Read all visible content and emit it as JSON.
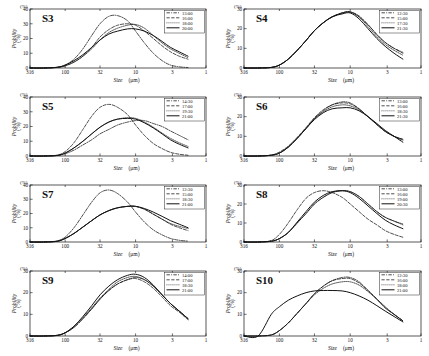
{
  "figure": {
    "panel_count": 8,
    "axis": {
      "xlabel_italic": "Size",
      "xlabel_unit": "(μm)",
      "ylabel_italic": "Probility",
      "ylabel_unit": "(%)",
      "x_ticks": [
        "316",
        "100",
        "32",
        "10",
        "3",
        "1"
      ],
      "x_tick_values": [
        316,
        100,
        32,
        10,
        3,
        1
      ],
      "y_ticks_40": [
        "0",
        "10",
        "20",
        "30",
        "40"
      ],
      "y_ticks_30": [
        "0",
        "10",
        "20",
        "30"
      ],
      "percent_marker": "(%)"
    },
    "line_styles": [
      "dashdot",
      "dashed",
      "dotted",
      "solid"
    ]
  },
  "chart_data": [
    {
      "type": "line",
      "title": "S3",
      "xlabel": "Size (μm)",
      "ylabel": "Probility (%)",
      "xlim": [
        316,
        1
      ],
      "ylim": [
        0,
        40
      ],
      "xscale": "log-reversed",
      "x_ticks": [
        316,
        100,
        32,
        10,
        3,
        1
      ],
      "y_ticks": [
        0,
        10,
        20,
        30,
        40
      ],
      "legend_position": "top-right",
      "x": [
        316,
        200,
        130,
        100,
        75,
        56,
        42,
        32,
        24,
        18,
        13,
        10,
        7.5,
        5.6,
        4.2,
        3.2,
        2.4,
        1.8
      ],
      "series": [
        {
          "name": "13:00",
          "style": "dashdot",
          "values": [
            0,
            0,
            0.5,
            2,
            6,
            13,
            22,
            30,
            35,
            35.5,
            32,
            25,
            17,
            10,
            5,
            2,
            0.8,
            0.3
          ]
        },
        {
          "name": "16:00",
          "style": "dashed",
          "values": [
            0,
            0,
            0.4,
            1.5,
            4,
            8,
            14,
            21,
            26,
            29,
            30,
            29,
            25,
            20,
            15,
            11,
            8,
            6
          ]
        },
        {
          "name": "18:00",
          "style": "dotted",
          "values": [
            0,
            0,
            0.4,
            1.5,
            4,
            8,
            13,
            19,
            24,
            27,
            29,
            29.5,
            27,
            22,
            17,
            13,
            10,
            7
          ]
        },
        {
          "name": "20:00",
          "style": "solid",
          "values": [
            0,
            0,
            0.5,
            2,
            5,
            9,
            14,
            19,
            23,
            25,
            26.5,
            26.5,
            25,
            22,
            18,
            14,
            11,
            8
          ]
        }
      ]
    },
    {
      "type": "line",
      "title": "S4",
      "xlabel": "Size (μm)",
      "ylabel": "Probility (%)",
      "xlim": [
        316,
        1
      ],
      "ylim": [
        0,
        30
      ],
      "xscale": "log-reversed",
      "x_ticks": [
        316,
        100,
        32,
        10,
        3,
        1
      ],
      "y_ticks": [
        0,
        10,
        20,
        30
      ],
      "legend_position": "top-right",
      "x": [
        316,
        200,
        130,
        100,
        75,
        56,
        42,
        32,
        24,
        18,
        13,
        10,
        7.5,
        5.6,
        4.2,
        3.2,
        2.4,
        1.8
      ],
      "series": [
        {
          "name": "12:30",
          "style": "dashdot",
          "values": [
            0,
            0,
            0.3,
            1.5,
            4.5,
            9,
            14,
            19,
            23,
            26,
            28,
            28.5,
            26,
            22,
            17,
            13,
            10,
            8
          ]
        },
        {
          "name": "15:00",
          "style": "dashed",
          "values": [
            0,
            0,
            0.3,
            1.5,
            4.5,
            9,
            14,
            19,
            23,
            26,
            28,
            28.5,
            26.5,
            22,
            17,
            13,
            10,
            7.5
          ]
        },
        {
          "name": "17:30",
          "style": "dotted",
          "values": [
            0,
            0,
            0.3,
            1.5,
            4.5,
            9,
            14,
            19,
            23,
            26,
            28,
            28.5,
            26,
            21,
            16,
            12,
            9,
            6.5
          ]
        },
        {
          "name": "21:30",
          "style": "solid",
          "values": [
            0,
            0,
            0.3,
            1.5,
            4.5,
            9,
            14,
            19,
            23,
            26,
            27.5,
            28,
            25,
            20,
            15,
            11,
            7.5,
            4.5
          ]
        }
      ]
    },
    {
      "type": "line",
      "title": "S5",
      "xlabel": "Size (μm)",
      "ylabel": "Probility (%)",
      "xlim": [
        316,
        1
      ],
      "ylim": [
        0,
        40
      ],
      "xscale": "log-reversed",
      "x_ticks": [
        316,
        100,
        32,
        10,
        3,
        1
      ],
      "y_ticks": [
        0,
        10,
        20,
        30,
        40
      ],
      "legend_position": "top-right",
      "x": [
        316,
        200,
        130,
        100,
        75,
        56,
        42,
        32,
        24,
        18,
        13,
        10,
        7.5,
        5.6,
        4.2,
        3.2,
        2.4,
        1.8
      ],
      "series": [
        {
          "name": "14:30",
          "style": "dashdot",
          "values": [
            0,
            0,
            0.3,
            1.5,
            4,
            7.5,
            11,
            15,
            18,
            21,
            23,
            24,
            24,
            22,
            20,
            17,
            14,
            11
          ]
        },
        {
          "name": "17:00",
          "style": "dashed",
          "values": [
            0,
            0,
            0.6,
            3,
            9,
            18,
            27,
            33,
            35,
            33,
            28,
            21,
            14,
            8.5,
            5,
            2.5,
            1.2,
            0.5
          ]
        },
        {
          "name": "19:30",
          "style": "dotted",
          "values": [
            0,
            0,
            0.4,
            2,
            5.5,
            10,
            15,
            19.5,
            23,
            25,
            26,
            25.5,
            23,
            19.5,
            15.5,
            12,
            9,
            6.5
          ]
        },
        {
          "name": "21:00",
          "style": "solid",
          "values": [
            0,
            0,
            0.4,
            2,
            5.5,
            10,
            15,
            19.5,
            23,
            25,
            25.5,
            25,
            22.5,
            19,
            15,
            11,
            8,
            5.5
          ]
        }
      ]
    },
    {
      "type": "line",
      "title": "S6",
      "xlabel": "Size (μm)",
      "ylabel": "Probility (%)",
      "xlim": [
        316,
        1
      ],
      "ylim": [
        0,
        30
      ],
      "xscale": "log-reversed",
      "x_ticks": [
        316,
        100,
        32,
        10,
        3,
        1
      ],
      "y_ticks": [
        0,
        10,
        20,
        30
      ],
      "legend_position": "top-right",
      "x": [
        316,
        200,
        130,
        100,
        75,
        56,
        42,
        32,
        24,
        18,
        13,
        10,
        7.5,
        5.6,
        4.2,
        3.2,
        2.4,
        1.8
      ],
      "series": [
        {
          "name": "13:00",
          "style": "dashdot",
          "values": [
            0,
            0,
            0.4,
            1.5,
            4.5,
            9,
            14,
            19,
            23,
            26,
            27.5,
            27,
            24,
            20,
            16,
            12.5,
            10,
            8
          ]
        },
        {
          "name": "16:00",
          "style": "dashed",
          "values": [
            0,
            0,
            0.5,
            2,
            5,
            9.5,
            14.5,
            19.5,
            23.5,
            26,
            27,
            26.5,
            24,
            20,
            16,
            12.5,
            10,
            8.5
          ]
        },
        {
          "name": "18:30",
          "style": "dotted",
          "values": [
            0,
            0,
            0.4,
            1.5,
            4.5,
            9,
            14,
            19,
            22.5,
            25,
            26,
            25.5,
            23.5,
            20,
            16,
            12.5,
            10,
            8.5
          ]
        },
        {
          "name": "21:30",
          "style": "solid",
          "values": [
            0,
            0,
            0.4,
            1.5,
            4.5,
            9,
            14,
            18.5,
            22,
            24,
            24.5,
            24.5,
            23,
            20,
            16.5,
            13,
            10,
            7
          ]
        }
      ]
    },
    {
      "type": "line",
      "title": "S7",
      "xlabel": "Size (μm)",
      "ylabel": "Probility (%)",
      "xlim": [
        316,
        1
      ],
      "ylim": [
        0,
        40
      ],
      "xscale": "log-reversed",
      "x_ticks": [
        316,
        100,
        32,
        10,
        3,
        1
      ],
      "y_ticks": [
        0,
        10,
        20,
        30,
        40
      ],
      "legend_position": "top-right",
      "x": [
        316,
        200,
        130,
        100,
        75,
        56,
        42,
        32,
        24,
        18,
        13,
        10,
        7.5,
        5.6,
        4.2,
        3.2,
        2.4,
        1.8
      ],
      "series": [
        {
          "name": "12:30",
          "style": "dashdot",
          "values": [
            0,
            0,
            0.8,
            3.5,
            10,
            19,
            28,
            34.5,
            36.5,
            34,
            28,
            21,
            14,
            8.5,
            5,
            2.5,
            1.2,
            0.6
          ]
        },
        {
          "name": "15:00",
          "style": "dashed",
          "values": [
            0,
            0,
            0.5,
            2.5,
            6,
            10.5,
            15,
            19,
            22,
            24,
            25,
            25,
            23,
            19.5,
            16,
            12.5,
            10,
            8
          ]
        },
        {
          "name": "18:30",
          "style": "dotted",
          "values": [
            0,
            0,
            0.5,
            2.5,
            6,
            10.5,
            15,
            19,
            22,
            24,
            25,
            25,
            23,
            19.5,
            16,
            13,
            11,
            9.5
          ]
        },
        {
          "name": "21:00",
          "style": "solid",
          "values": [
            0,
            0,
            0.5,
            2.5,
            6,
            10.5,
            15,
            19,
            22,
            24,
            25,
            25,
            23.5,
            21,
            18,
            15,
            12.5,
            10
          ]
        }
      ]
    },
    {
      "type": "line",
      "title": "S8",
      "xlabel": "Size (μm)",
      "ylabel": "Probility (%)",
      "xlim": [
        316,
        1
      ],
      "ylim": [
        0,
        30
      ],
      "xscale": "log-reversed",
      "x_ticks": [
        316,
        100,
        32,
        10,
        3,
        1
      ],
      "y_ticks": [
        0,
        10,
        20,
        30
      ],
      "legend_position": "top-right",
      "x": [
        316,
        200,
        130,
        100,
        75,
        56,
        42,
        32,
        24,
        18,
        13,
        10,
        7.5,
        5.6,
        4.2,
        3.2,
        2.4,
        1.8
      ],
      "series": [
        {
          "name": "13:00",
          "style": "dashdot",
          "values": [
            0,
            0,
            0.4,
            1.8,
            5,
            10,
            15,
            20,
            23.5,
            26,
            27,
            26.5,
            24,
            20,
            16,
            13,
            11,
            9
          ]
        },
        {
          "name": "16:00",
          "style": "dashed",
          "values": [
            0,
            0,
            0.8,
            4,
            10,
            17,
            23,
            26,
            27,
            26,
            23.5,
            20,
            16,
            12,
            9,
            6,
            4,
            2.5
          ]
        },
        {
          "name": "19:00",
          "style": "dotted",
          "values": [
            0,
            0,
            0.4,
            1.8,
            5,
            10,
            15,
            20,
            23.5,
            26,
            27,
            26.5,
            24,
            20,
            16,
            13,
            11,
            9.5
          ]
        },
        {
          "name": "20:30",
          "style": "solid",
          "values": [
            0,
            0,
            0.4,
            1.8,
            5,
            10.5,
            16,
            21,
            24.5,
            26.5,
            27,
            26,
            23,
            19,
            15,
            11.5,
            9,
            7
          ]
        }
      ]
    },
    {
      "type": "line",
      "title": "S9",
      "xlabel": "Size (μm)",
      "ylabel": "Probility (%)",
      "xlim": [
        316,
        1
      ],
      "ylim": [
        0,
        30
      ],
      "xscale": "log-reversed",
      "x_ticks": [
        316,
        100,
        32,
        10,
        3,
        1
      ],
      "y_ticks": [
        0,
        10,
        20,
        30
      ],
      "legend_position": "top-right",
      "x": [
        316,
        200,
        130,
        100,
        75,
        56,
        42,
        32,
        24,
        18,
        13,
        10,
        7.5,
        5.6,
        4.2,
        3.2,
        2.4,
        1.8
      ],
      "series": [
        {
          "name": "14:00",
          "style": "dashdot",
          "values": [
            0,
            0,
            0.3,
            1.5,
            4,
            8,
            12.5,
            17,
            21,
            24,
            26,
            27,
            26,
            23,
            19,
            15,
            11.5,
            8
          ]
        },
        {
          "name": "17:00",
          "style": "dashed",
          "values": [
            0,
            0,
            0.3,
            1.5,
            4,
            8,
            12.5,
            17,
            21,
            24,
            26,
            26.5,
            25,
            22,
            18,
            14,
            11,
            7.5
          ]
        },
        {
          "name": "18:30",
          "style": "dotted",
          "values": [
            0,
            0,
            0.3,
            1.5,
            4.5,
            8.5,
            13,
            17.5,
            21.5,
            25,
            27,
            27.5,
            26,
            23,
            19,
            15,
            11.5,
            8
          ]
        },
        {
          "name": "21:00",
          "style": "solid",
          "values": [
            0,
            0,
            0.3,
            1.5,
            4.5,
            9,
            14,
            19,
            23,
            26,
            28,
            28.5,
            27,
            23.5,
            19,
            15,
            11.5,
            8
          ]
        }
      ]
    },
    {
      "type": "line",
      "title": "S10",
      "xlabel": "Size (μm)",
      "ylabel": "Probility (%)",
      "xlim": [
        316,
        1
      ],
      "ylim": [
        0,
        30
      ],
      "xscale": "log-reversed",
      "x_ticks": [
        316,
        100,
        32,
        10,
        3,
        1
      ],
      "y_ticks": [
        0,
        10,
        20,
        30
      ],
      "legend_position": "top-right",
      "x": [
        316,
        200,
        130,
        100,
        75,
        56,
        42,
        32,
        24,
        18,
        13,
        10,
        7.5,
        5.6,
        4.2,
        3.2,
        2.4,
        1.8
      ],
      "series": [
        {
          "name": "12:30",
          "style": "dashdot",
          "values": [
            0,
            0,
            0.5,
            2.5,
            6,
            10.5,
            15,
            19.5,
            23,
            25.5,
            27,
            27,
            25,
            21,
            17,
            13,
            10,
            7
          ]
        },
        {
          "name": "16:00",
          "style": "dashed",
          "values": [
            0,
            0,
            0.5,
            2.5,
            6,
            10.5,
            15,
            19.5,
            23,
            25.5,
            26.5,
            26.5,
            24.5,
            21,
            17,
            13,
            10,
            7
          ]
        },
        {
          "name": "18:00",
          "style": "dotted",
          "values": [
            0,
            0,
            0.5,
            2.5,
            6,
            10.5,
            15,
            19,
            22,
            24,
            25,
            25,
            23.5,
            20.5,
            17,
            13.5,
            10,
            7
          ]
        },
        {
          "name": "21:00",
          "style": "solid",
          "values": [
            0,
            0,
            10,
            13.5,
            16.5,
            18.5,
            20,
            20.8,
            21,
            21,
            20.8,
            20,
            18.5,
            16.5,
            14,
            11.5,
            9,
            6.5
          ]
        }
      ]
    }
  ]
}
